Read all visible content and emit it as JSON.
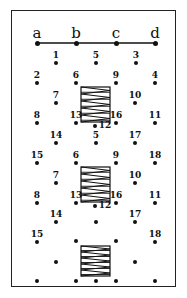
{
  "diagram": {
    "type": "connection-grid-with-coils",
    "bus_line": {
      "y": 43,
      "x1": 37,
      "x2": 155,
      "terminals": [
        {
          "label": "a",
          "x": 37
        },
        {
          "label": "b",
          "x": 76
        },
        {
          "label": "c",
          "x": 116
        },
        {
          "label": "d",
          "x": 155
        }
      ]
    },
    "points": [
      {
        "label": "1",
        "x": 56,
        "y": 63
      },
      {
        "label": "5",
        "x": 96,
        "y": 63
      },
      {
        "label": "3",
        "x": 136,
        "y": 63
      },
      {
        "label": "2",
        "x": 37,
        "y": 83
      },
      {
        "label": "6",
        "x": 76,
        "y": 83
      },
      {
        "label": "9",
        "x": 116,
        "y": 83
      },
      {
        "label": "4",
        "x": 155,
        "y": 83
      },
      {
        "label": "7",
        "x": 56,
        "y": 103
      },
      {
        "label": "10",
        "x": 135,
        "y": 103
      },
      {
        "label": "8",
        "x": 37,
        "y": 123
      },
      {
        "label": "13",
        "x": 76,
        "y": 123
      },
      {
        "label": "12",
        "x": 95,
        "y": 126,
        "label_side": "right"
      },
      {
        "label": "16",
        "x": 116,
        "y": 123
      },
      {
        "label": "11",
        "x": 155,
        "y": 123
      },
      {
        "label": "14",
        "x": 56,
        "y": 143
      },
      {
        "label": "5",
        "x": 96,
        "y": 143
      },
      {
        "label": "17",
        "x": 135,
        "y": 143
      },
      {
        "label": "15",
        "x": 37,
        "y": 163
      },
      {
        "label": "6",
        "x": 76,
        "y": 163
      },
      {
        "label": "9",
        "x": 116,
        "y": 163
      },
      {
        "label": "18",
        "x": 155,
        "y": 163
      },
      {
        "label": "7",
        "x": 56,
        "y": 183
      },
      {
        "label": "10",
        "x": 135,
        "y": 183
      },
      {
        "label": "8",
        "x": 37,
        "y": 203
      },
      {
        "label": "13",
        "x": 76,
        "y": 203
      },
      {
        "label": "12",
        "x": 95,
        "y": 206,
        "label_side": "right"
      },
      {
        "label": "16",
        "x": 116,
        "y": 203
      },
      {
        "label": "11",
        "x": 155,
        "y": 203
      },
      {
        "label": "14",
        "x": 56,
        "y": 222
      },
      {
        "label": "",
        "x": 96,
        "y": 222
      },
      {
        "label": "17",
        "x": 135,
        "y": 222
      },
      {
        "label": "15",
        "x": 37,
        "y": 242
      },
      {
        "label": "",
        "x": 76,
        "y": 241
      },
      {
        "label": "",
        "x": 116,
        "y": 241
      },
      {
        "label": "18",
        "x": 155,
        "y": 242
      },
      {
        "label": "",
        "x": 56,
        "y": 262
      },
      {
        "label": "",
        "x": 135,
        "y": 262
      },
      {
        "label": "",
        "x": 37,
        "y": 281
      },
      {
        "label": "",
        "x": 76,
        "y": 281
      },
      {
        "label": "",
        "x": 96,
        "y": 281
      },
      {
        "label": "",
        "x": 116,
        "y": 281
      },
      {
        "label": "",
        "x": 155,
        "y": 281
      }
    ],
    "coils": [
      {
        "x": 81,
        "y": 87,
        "w": 29,
        "h": 35,
        "turns": 5
      },
      {
        "x": 81,
        "y": 167,
        "w": 29,
        "h": 35,
        "turns": 5
      },
      {
        "x": 81,
        "y": 246,
        "w": 29,
        "h": 30,
        "turns": 5
      }
    ]
  }
}
